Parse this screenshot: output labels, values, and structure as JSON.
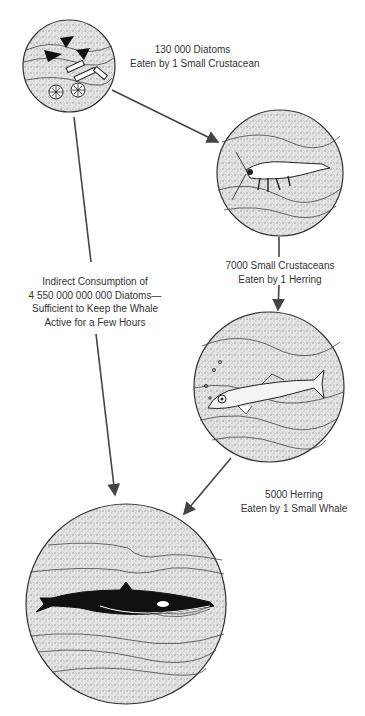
{
  "diagram": {
    "type": "food-chain",
    "nodes": [
      {
        "id": "diatoms",
        "label": "Diatoms",
        "icon": "diatoms-icon"
      },
      {
        "id": "crustacean",
        "label": "Small Crustacean",
        "icon": "shrimp-icon"
      },
      {
        "id": "herring",
        "label": "Herring",
        "icon": "fish-icon"
      },
      {
        "id": "whale",
        "label": "Small Whale",
        "icon": "whale-icon"
      }
    ],
    "edges": [
      {
        "from": "diatoms",
        "to": "crustacean",
        "label_lines": [
          "130 000 Diatoms",
          "Eaten by 1 Small Crustacean"
        ]
      },
      {
        "from": "crustacean",
        "to": "herring",
        "label_lines": [
          "7000 Small Crustaceans",
          "Eaten by 1 Herring"
        ]
      },
      {
        "from": "herring",
        "to": "whale",
        "label_lines": [
          "5000 Herring",
          "Eaten by 1 Small Whale"
        ]
      },
      {
        "from": "diatoms",
        "to": "whale",
        "label_lines": [
          "Indirect Consumption of",
          "4 550 000 000 000 Diatoms—",
          "Sufficient to Keep the Whale",
          "Active for a Few Hours"
        ]
      }
    ]
  },
  "colors": {
    "ink": "#333333",
    "stipple": "#d8d8d8",
    "background": "#ffffff"
  }
}
